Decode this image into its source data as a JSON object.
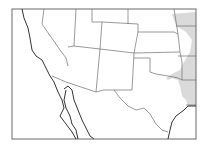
{
  "map": {
    "title": "Southwestern United States and northern Mexico outline map",
    "frame": {
      "x": 12,
      "y": 9,
      "w": 184,
      "h": 130
    },
    "colors": {
      "background": "#ffffff",
      "state_border": "#6f6f6f",
      "coast_border": "#333333",
      "frame": "#6a6a6a",
      "shaded_region": "#d6d6d6"
    },
    "regions": [
      {
        "name": "California",
        "shaded": false
      },
      {
        "name": "Nevada",
        "shaded": false
      },
      {
        "name": "Utah",
        "shaded": false
      },
      {
        "name": "Arizona",
        "shaded": false
      },
      {
        "name": "Colorado",
        "shaded": false
      },
      {
        "name": "New Mexico",
        "shaded": false
      },
      {
        "name": "Wyoming",
        "shaded": false
      },
      {
        "name": "Nebraska",
        "shaded": false
      },
      {
        "name": "Kansas",
        "shaded": false
      },
      {
        "name": "Oklahoma",
        "shaded": false
      },
      {
        "name": "Texas",
        "shaded": false
      },
      {
        "name": "Iowa/Missouri/Arkansas/Louisiana border area",
        "shaded": true
      },
      {
        "name": "Mexico",
        "shaded": false
      },
      {
        "name": "Baja California",
        "shaded": false
      }
    ]
  }
}
